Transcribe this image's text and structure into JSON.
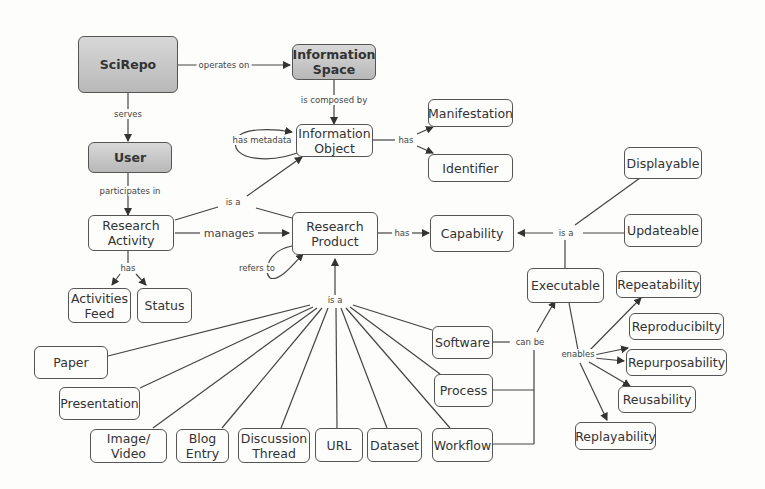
{
  "nodes": {
    "scirepo": "SciRepo",
    "info_space": "Information\nSpace",
    "user": "User",
    "info_object": "Information\nObject",
    "manifestation": "Manifestation",
    "identifier": "Identifier",
    "research_activity": "Research\nActivity",
    "research_product": "Research\nProduct",
    "capability": "Capability",
    "displayable": "Displayable",
    "updateable": "Updateable",
    "executable": "Executable",
    "activities_feed": "Activities\nFeed",
    "status": "Status",
    "repeatability": "Repeatability",
    "reproducibility": "Reproducibilty",
    "repurposability": "Repurposability",
    "reusability": "Reusability",
    "replayability": "Replayability",
    "paper": "Paper",
    "presentation": "Presentation",
    "image_video": "Image/\nVideo",
    "blog_entry": "Blog\nEntry",
    "discussion_thread": "Discussion\nThread",
    "url": "URL",
    "dataset": "Dataset",
    "workflow": "Workflow",
    "software": "Software",
    "process": "Process"
  },
  "links": {
    "operates_on": "operates on",
    "is_composed_by": "is composed by",
    "serves": "serves",
    "has_metadata": "has metadata",
    "participates_in": "participates in",
    "has_info": "has",
    "is_a_top": "is a",
    "manages": "manages",
    "refers_to": "refers to",
    "has_capability": "has",
    "is_a_capability": "is a",
    "has_activity": "has",
    "is_a_bottom": "is a",
    "can_be": "can be",
    "enables": "enables"
  }
}
